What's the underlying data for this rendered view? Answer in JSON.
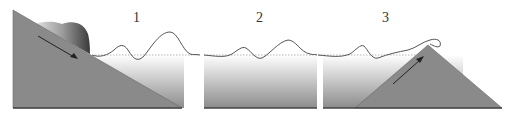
{
  "diagram": {
    "panels": [
      {
        "id": 1,
        "label": "1",
        "description": "Landslide sliding down slope into water generating waves"
      },
      {
        "id": 2,
        "label": "2",
        "description": "Waves propagating across open water"
      },
      {
        "id": 3,
        "label": "3",
        "description": "Wave running up opposite slope"
      }
    ],
    "colors": {
      "slope": "#8a8a8a",
      "slope_edge": "#555555",
      "water_top": "#ffffff",
      "water_bottom": "#8c8c8c",
      "wave_line": "#555555",
      "still_water_line": "#999999",
      "ground_line": "#444444",
      "arrow": "#222222"
    }
  }
}
